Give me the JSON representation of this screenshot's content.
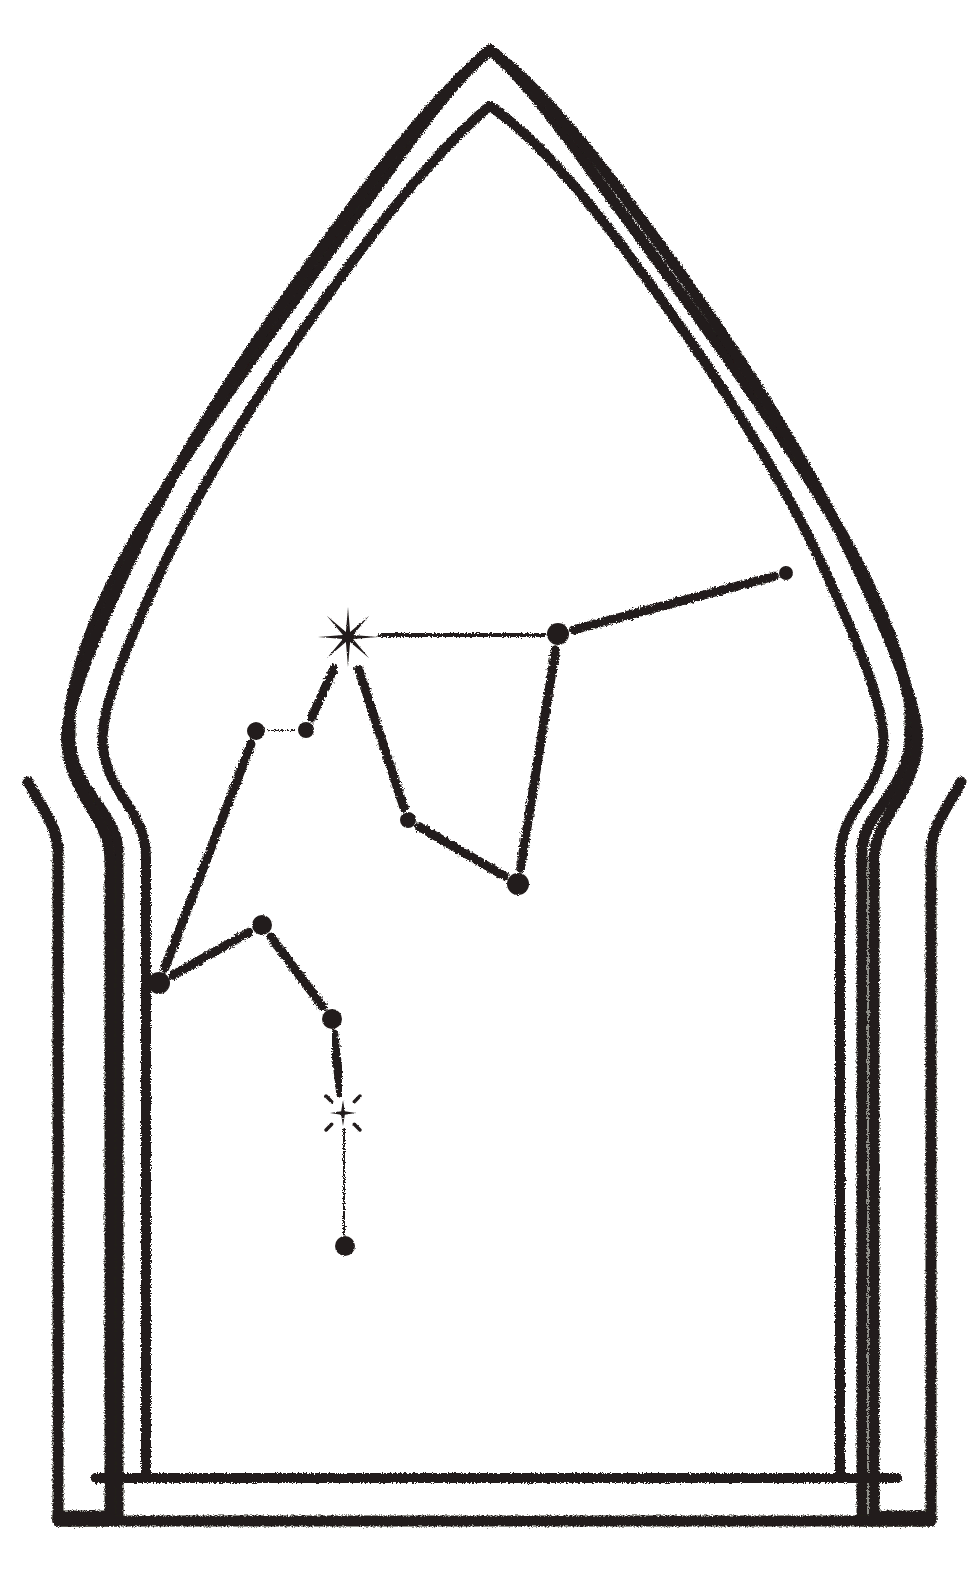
{
  "artwork": {
    "title": "Constellation in Ogee Arch",
    "medium": "charcoal-stamp-line-drawing",
    "background_color": "#ffffff",
    "ink_color": "#241f1d",
    "canvas": {
      "width": 967,
      "height": 1582
    }
  },
  "frame": {
    "name": "double-outline-ogee-arch",
    "stroke_width_outer": 11,
    "stroke_width_inner": 10,
    "apex": {
      "x": 490,
      "y": 50
    },
    "inner_apex": {
      "x": 490,
      "y": 106
    },
    "widest_outer_x_left": 66,
    "widest_outer_x_right": 915,
    "widest_inner_x_left": 104,
    "widest_inner_x_right": 877,
    "shoulder_notch_top_y": 742,
    "shoulder_notch_bottom_y": 866,
    "base_outer_y": 1521,
    "base_inner_y": 1478,
    "base_outer_x_left": 58,
    "base_outer_x_right": 931,
    "base_inner_x_left": 96,
    "base_inner_x_right": 897
  },
  "constellation": {
    "name": "big-dipper",
    "star_count": 11,
    "bright_star_label": "8-point-starburst",
    "small_star_label": "4-point-twinkle-star",
    "nodes": [
      {
        "id": "n1",
        "name": "node-far-right",
        "x": 786,
        "y": 573,
        "r": 7,
        "type": "dot"
      },
      {
        "id": "n2",
        "name": "node-bowl-top-right",
        "x": 558,
        "y": 634,
        "r": 11,
        "type": "dot"
      },
      {
        "id": "n3",
        "name": "star-bright-main",
        "x": 348,
        "y": 637,
        "r": 30,
        "type": "starburst8"
      },
      {
        "id": "n4",
        "name": "node-pair-right",
        "x": 306,
        "y": 730,
        "r": 8,
        "type": "dot"
      },
      {
        "id": "n5",
        "name": "node-pair-left",
        "x": 256,
        "y": 731,
        "r": 9,
        "type": "dot"
      },
      {
        "id": "n6",
        "name": "node-mid-small",
        "x": 408,
        "y": 820,
        "r": 8,
        "type": "dot"
      },
      {
        "id": "n7",
        "name": "node-bowl-bottom",
        "x": 518,
        "y": 884,
        "r": 11,
        "type": "dot"
      },
      {
        "id": "n8",
        "name": "node-lower-left-tip",
        "x": 159,
        "y": 983,
        "r": 11,
        "type": "dot"
      },
      {
        "id": "n9",
        "name": "node-lower-mid",
        "x": 262,
        "y": 925,
        "r": 10,
        "type": "dot"
      },
      {
        "id": "n10",
        "name": "node-tail-upper",
        "x": 332,
        "y": 1019,
        "r": 10,
        "type": "dot"
      },
      {
        "id": "n11",
        "name": "star-small-twinkle",
        "x": 343,
        "y": 1113,
        "r": 13,
        "type": "star4"
      },
      {
        "id": "n12",
        "name": "node-tail-bottom",
        "x": 345,
        "y": 1246,
        "r": 10,
        "type": "dot"
      }
    ],
    "edges": [
      {
        "name": "edge-n2-n1",
        "from": "n2",
        "to": "n1",
        "style": "solid"
      },
      {
        "name": "edge-n3-n2",
        "from": "n3",
        "to": "n2",
        "style": "solid"
      },
      {
        "name": "edge-n2-n7",
        "from": "n2",
        "to": "n7",
        "style": "solid"
      },
      {
        "name": "edge-n3-n6",
        "from": "n3",
        "to": "n6",
        "style": "solid"
      },
      {
        "name": "edge-n6-n7",
        "from": "n6",
        "to": "n7",
        "style": "solid"
      },
      {
        "name": "edge-n3-n4",
        "from": "n3",
        "to": "n4",
        "style": "solid"
      },
      {
        "name": "edge-n4-n5",
        "from": "n4",
        "to": "n5",
        "style": "dashed"
      },
      {
        "name": "edge-n5-n8",
        "from": "n5",
        "to": "n8",
        "style": "solid"
      },
      {
        "name": "edge-n8-n9",
        "from": "n8",
        "to": "n9",
        "style": "solid"
      },
      {
        "name": "edge-n9-n10",
        "from": "n9",
        "to": "n10",
        "style": "solid"
      },
      {
        "name": "edge-n10-n11",
        "from": "n10",
        "to": "n11",
        "style": "solid"
      },
      {
        "name": "edge-n11-n12",
        "from": "n11",
        "to": "n12",
        "style": "solid"
      }
    ]
  }
}
